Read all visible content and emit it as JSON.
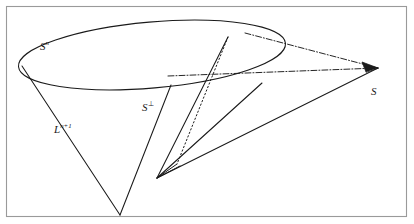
{
  "figure": {
    "kind": "geometry-diagram",
    "background_color": "#ffffff",
    "stroke_color": "#1a1a1a",
    "frame_color": "#9a9a9a",
    "canvas": {
      "width": 414,
      "height": 224
    },
    "frame": {
      "x": 6,
      "y": 6,
      "width": 401,
      "height": 211
    },
    "labels": {
      "sphere": {
        "base": "S",
        "sup": "n"
      },
      "perp": {
        "base": "S",
        "sup": "⊥"
      },
      "lightcone": {
        "base": "L",
        "sup": "n+1"
      },
      "point_s": {
        "base": "S",
        "sup": ""
      }
    },
    "ellipse": {
      "cx": 152,
      "cy": 55,
      "rx": 134,
      "ry": 33,
      "rotation": -5
    },
    "points": {
      "apex_lower": {
        "x": 120,
        "y": 215
      },
      "vertex_inner": {
        "x": 157,
        "y": 178
      },
      "point_s_tip": {
        "x": 378,
        "y": 68
      },
      "ellipse_top": {
        "x": 228,
        "y": 37
      },
      "ellipse_left_tangent": {
        "x": 25,
        "y": 69
      },
      "ellipse_right_lower": {
        "x": 262,
        "y": 83
      },
      "chord_left": {
        "x": 171,
        "y": 85
      }
    }
  }
}
